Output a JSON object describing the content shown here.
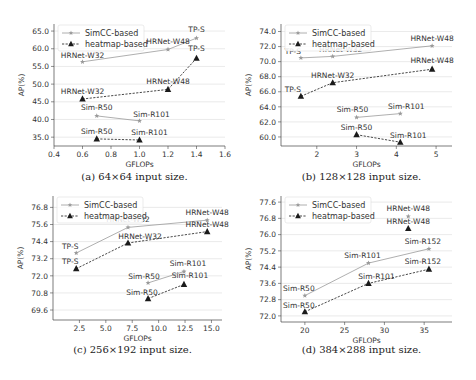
{
  "chart_data": [
    {
      "type": "line",
      "caption": "(a) 64×64 input size.",
      "xlabel": "GFLOPs",
      "ylabel": "AP(%)",
      "xlim": [
        0.4,
        1.6
      ],
      "ylim": [
        32.5,
        67.0
      ],
      "xticks": [
        0.4,
        0.6,
        0.8,
        1.0,
        1.2,
        1.4,
        1.6
      ],
      "xtick_labels": [
        "0.4",
        "0.6",
        "0.8",
        "1.0",
        "1.2",
        "1.4",
        "1.6"
      ],
      "yticks": [
        35.0,
        40.0,
        45.0,
        50.0,
        55.0,
        60.0,
        65.0
      ],
      "ytick_labels": [
        "35.0",
        "40.0",
        "45.0",
        "50.0",
        "55.0",
        "60.0",
        "65.0"
      ],
      "grid": "horizontal",
      "legend": "top-left",
      "series": [
        {
          "name": "SimCC-based",
          "groups": [
            [
              {
                "label": "HRNet-W32",
                "x": 0.6,
                "y": 56.3
              },
              {
                "label": "HRNet-W48",
                "x": 1.2,
                "y": 59.8
              },
              {
                "label": "TP-S",
                "x": 1.4,
                "y": 63.0
              }
            ],
            [
              {
                "label": "Sim-R50",
                "x": 0.7,
                "y": 41.0
              },
              {
                "label": "Sim-R101",
                "x": 1.0,
                "y": 39.6
              }
            ]
          ]
        },
        {
          "name": "heatmap-based",
          "groups": [
            [
              {
                "label": "HRNet-W32",
                "x": 0.6,
                "y": 45.8
              },
              {
                "label": "HRNet-W48",
                "x": 1.2,
                "y": 48.5
              },
              {
                "label": "TP-S",
                "x": 1.4,
                "y": 57.3
              }
            ],
            [
              {
                "label": "Sim-R50",
                "x": 0.7,
                "y": 34.5
              },
              {
                "label": "Sim-R101",
                "x": 1.0,
                "y": 34.2
              }
            ]
          ]
        }
      ]
    },
    {
      "type": "line",
      "caption": "(b) 128×128 input size.",
      "xlabel": "GFLOPs",
      "ylabel": "AP(%)",
      "xlim": [
        1.1,
        5.4
      ],
      "ylim": [
        58.8,
        75.0
      ],
      "xticks": [
        2,
        3,
        4,
        5
      ],
      "xtick_labels": [
        "2",
        "3",
        "4",
        "5"
      ],
      "yticks": [
        60.0,
        62.0,
        64.0,
        66.0,
        68.0,
        70.0,
        72.0,
        74.0
      ],
      "ytick_labels": [
        "60.0",
        "62.0",
        "64.0",
        "66.0",
        "68.0",
        "70.0",
        "72.0",
        "74.0"
      ],
      "grid": "horizontal",
      "legend": "top-left",
      "series": [
        {
          "name": "SimCC-based",
          "groups": [
            [
              {
                "label": "TP-S",
                "x": 1.6,
                "y": 70.5
              },
              {
                "label": "HRNet-W32",
                "x": 2.4,
                "y": 70.7
              },
              {
                "label": "HRNet-W48",
                "x": 4.9,
                "y": 72.1
              }
            ],
            [
              {
                "label": "Sim-R50",
                "x": 3.0,
                "y": 62.6
              },
              {
                "label": "Sim-R101",
                "x": 4.1,
                "y": 63.1
              }
            ]
          ]
        },
        {
          "name": "heatmap-based",
          "groups": [
            [
              {
                "label": "TP-S",
                "x": 1.6,
                "y": 65.4
              },
              {
                "label": "HRNet-W32",
                "x": 2.4,
                "y": 67.2
              },
              {
                "label": "HRNet-W48",
                "x": 4.9,
                "y": 69.0
              }
            ],
            [
              {
                "label": "Sim-R50",
                "x": 3.0,
                "y": 60.3
              },
              {
                "label": "Sim-R101",
                "x": 4.1,
                "y": 59.3
              }
            ]
          ]
        }
      ]
    },
    {
      "type": "line",
      "caption": "(c) 256×192 input size.",
      "xlabel": "GFLOPs",
      "ylabel": "AP(%)",
      "xlim": [
        0.0,
        16.0
      ],
      "ylim": [
        68.9,
        77.6
      ],
      "xticks": [
        2.5,
        5.0,
        7.5,
        10.0,
        12.5,
        15.0
      ],
      "xtick_labels": [
        "2.5",
        "5.0",
        "7.5",
        "10.0",
        "12.5",
        "15.0"
      ],
      "yticks": [
        69.6,
        70.8,
        72.0,
        73.2,
        74.4,
        75.6,
        76.8
      ],
      "ytick_labels": [
        "69.6",
        "70.8",
        "72.0",
        "73.2",
        "74.4",
        "75.6",
        "76.8"
      ],
      "grid": "horizontal",
      "legend": "top-left",
      "series": [
        {
          "name": "SimCC-based",
          "groups": [
            [
              {
                "label": "TP-S",
                "x": 2.2,
                "y": 73.6
              },
              {
                "label": "HRNet-W32",
                "x": 7.1,
                "y": 75.4
              },
              {
                "label": "HRNet-W48",
                "x": 14.6,
                "y": 75.9
              }
            ],
            [
              {
                "label": "Sim-R50",
                "x": 9.0,
                "y": 71.5
              },
              {
                "label": "Sim-R101",
                "x": 12.4,
                "y": 72.3
              }
            ]
          ]
        },
        {
          "name": "heatmap-based",
          "groups": [
            [
              {
                "label": "TP-S",
                "x": 2.2,
                "y": 72.5
              },
              {
                "label": "HRNet-W32",
                "x": 7.1,
                "y": 74.3
              },
              {
                "label": "HRNet-W48",
                "x": 14.6,
                "y": 75.1
              }
            ],
            [
              {
                "label": "Sim-R50",
                "x": 9.0,
                "y": 70.4
              },
              {
                "label": "Sim-R101",
                "x": 12.4,
                "y": 71.4
              }
            ]
          ]
        }
      ]
    },
    {
      "type": "line",
      "caption": "(d) 384×288 input size.",
      "xlabel": "GFLOPs",
      "ylabel": "AP(%)",
      "xlim": [
        17.0,
        38.5
      ],
      "ylim": [
        71.7,
        77.9
      ],
      "xticks": [
        20,
        25,
        30,
        35
      ],
      "xtick_labels": [
        "20",
        "25",
        "30",
        "35"
      ],
      "yticks": [
        72.0,
        72.8,
        73.6,
        74.4,
        75.2,
        76.0,
        76.8,
        77.6
      ],
      "ytick_labels": [
        "72.0",
        "72.8",
        "73.6",
        "74.4",
        "75.2",
        "76.0",
        "76.8",
        "77.6"
      ],
      "grid": "horizontal",
      "legend": "top-left",
      "series": [
        {
          "name": "SimCC-based",
          "groups": [
            [
              {
                "label": "Sim-R50",
                "x": 20.0,
                "y": 73.0
              },
              {
                "label": "Sim-R101",
                "x": 28.0,
                "y": 74.6
              },
              {
                "label": "Sim-R152",
                "x": 35.6,
                "y": 75.3
              }
            ],
            [
              {
                "label": "HRNet-W48",
                "x": 33.0,
                "y": 76.9
              }
            ]
          ]
        },
        {
          "name": "heatmap-based",
          "groups": [
            [
              {
                "label": "Sim-R50",
                "x": 20.0,
                "y": 72.2
              },
              {
                "label": "Sim-R101",
                "x": 28.0,
                "y": 73.6
              },
              {
                "label": "Sim-R152",
                "x": 35.6,
                "y": 74.3
              }
            ],
            [
              {
                "label": "HRNet-W48",
                "x": 33.0,
                "y": 76.3
              }
            ]
          ]
        }
      ]
    }
  ],
  "colors": {
    "simcc": "#9a9a9a",
    "heatmap": "#1a1a1a",
    "grid": "#e4e4e4",
    "axis": "#444444"
  }
}
